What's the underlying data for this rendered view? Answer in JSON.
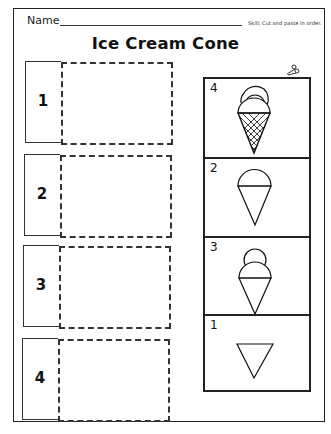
{
  "header": {
    "name_label": "Name",
    "skill_text": "Skill: Cut and paste in order.",
    "title": "Ice Cream Cone"
  },
  "answer_slots": [
    {
      "number": "1"
    },
    {
      "number": "2"
    },
    {
      "number": "3"
    },
    {
      "number": "4"
    }
  ],
  "cut_out_cards": [
    {
      "label": "4",
      "picture": "cone-with-waffle-pattern-and-two-scoops"
    },
    {
      "label": "2",
      "picture": "cone-with-one-scoop"
    },
    {
      "label": "3",
      "picture": "cone-with-two-scoops"
    },
    {
      "label": "1",
      "picture": "empty-cone"
    }
  ],
  "icons": {
    "cut_line": "scissors-icon"
  }
}
